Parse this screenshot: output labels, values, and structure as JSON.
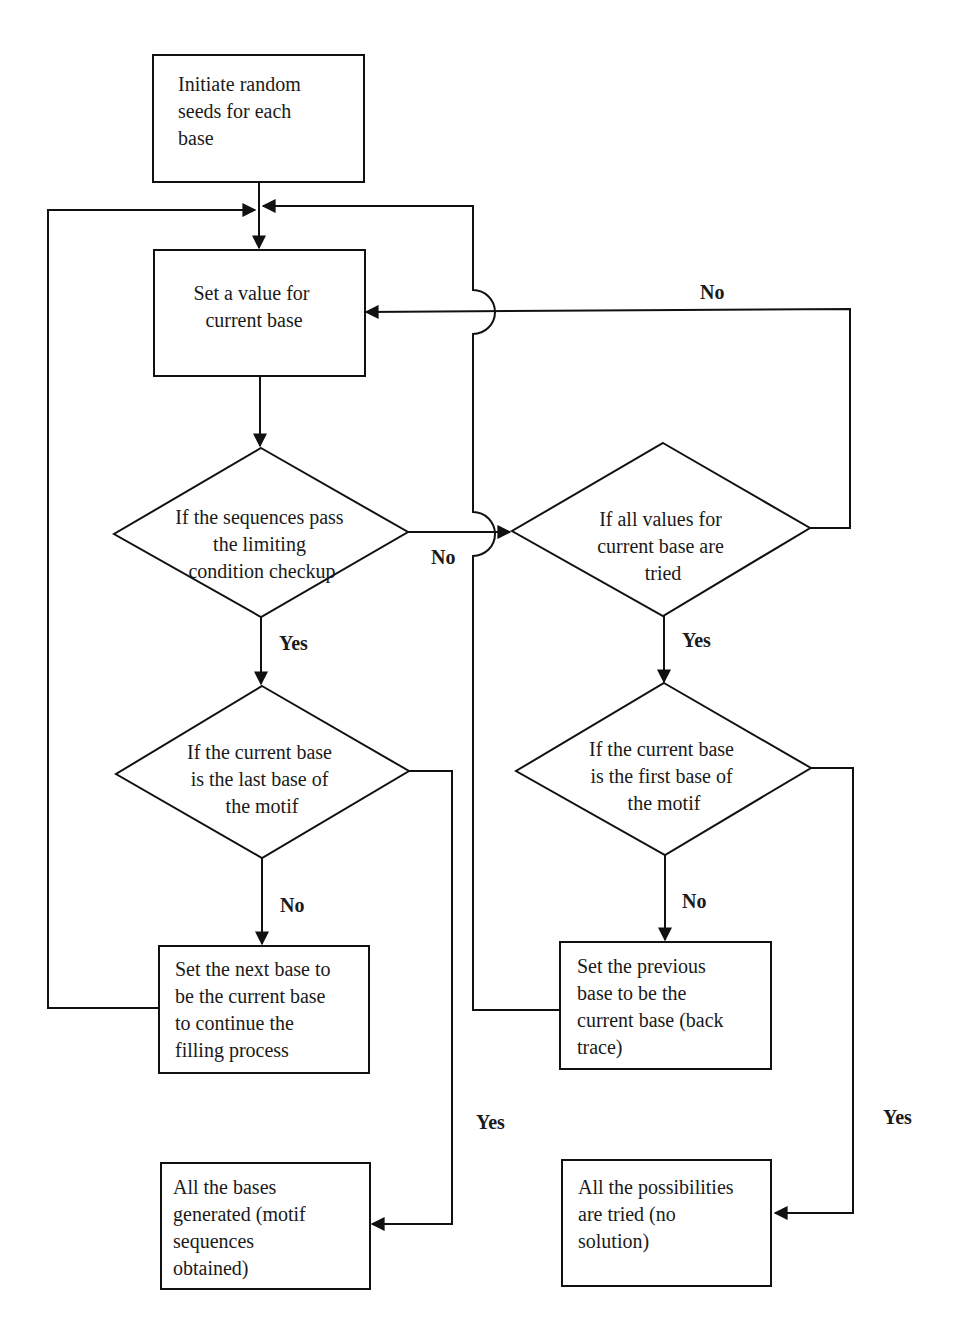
{
  "nodes": {
    "init": {
      "lines": [
        "Initiate random",
        "seeds for each",
        "base"
      ]
    },
    "set_value": {
      "lines": [
        "Set a value for",
        "current base"
      ]
    },
    "check_limit": {
      "lines": [
        "If the sequences pass",
        "the limiting",
        "condition checkup"
      ]
    },
    "all_values_tried": {
      "lines": [
        "If all values for",
        "current base are",
        "tried"
      ]
    },
    "is_last": {
      "lines": [
        "If the current base",
        "is the last base of",
        "the motif"
      ]
    },
    "is_first": {
      "lines": [
        "If the current base",
        "is the first base of",
        "the motif"
      ]
    },
    "next_base": {
      "lines": [
        "Set the next base to",
        "be the current base",
        "to continue the",
        "filling process"
      ]
    },
    "prev_base": {
      "lines": [
        "Set the previous",
        "base to be the",
        "current base (back",
        "trace)"
      ]
    },
    "done_success": {
      "lines": [
        "All the bases",
        "generated (motif",
        "sequences",
        "obtained)"
      ]
    },
    "done_fail": {
      "lines": [
        "All the possibilities",
        "are tried (no",
        "solution)"
      ]
    }
  },
  "edge_labels": {
    "all_tried_no": "No",
    "check_no": "No",
    "check_yes": "Yes",
    "all_tried_yes": "Yes",
    "last_no": "No",
    "first_no": "No",
    "last_yes": "Yes",
    "first_yes": "Yes"
  },
  "colors": {
    "stroke": "#111111",
    "background": "#ffffff"
  }
}
